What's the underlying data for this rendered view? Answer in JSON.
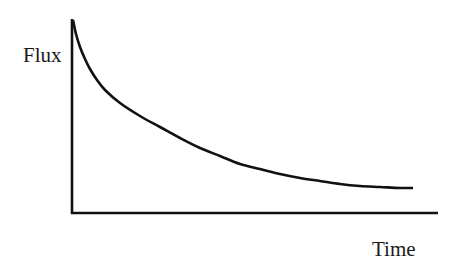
{
  "chart_data": {
    "type": "line",
    "title": "",
    "xlabel": "Time",
    "ylabel": "Flux",
    "xticks": [],
    "yticks": [],
    "grid": false,
    "legend": null,
    "series": [
      {
        "name": "Flux",
        "color": "#111111",
        "points_px": [
          [
            73,
            20
          ],
          [
            76,
            34
          ],
          [
            80,
            47
          ],
          [
            85,
            59
          ],
          [
            90,
            69
          ],
          [
            97,
            80
          ],
          [
            105,
            90
          ],
          [
            120,
            103
          ],
          [
            140,
            116
          ],
          [
            160,
            127
          ],
          [
            180,
            138
          ],
          [
            200,
            148
          ],
          [
            220,
            156
          ],
          [
            240,
            164
          ],
          [
            260,
            169
          ],
          [
            280,
            174
          ],
          [
            300,
            178
          ],
          [
            320,
            181
          ],
          [
            340,
            184
          ],
          [
            360,
            186
          ],
          [
            380,
            187
          ],
          [
            400,
            188
          ],
          [
            413,
            188
          ]
        ],
        "x_norm": [
          0.0,
          0.01,
          0.02,
          0.03,
          0.05,
          0.07,
          0.09,
          0.14,
          0.19,
          0.25,
          0.31,
          0.37,
          0.43,
          0.49,
          0.55,
          0.61,
          0.67,
          0.73,
          0.79,
          0.85,
          0.9,
          0.96,
          1.0
        ],
        "y_norm": [
          1.0,
          0.93,
          0.86,
          0.8,
          0.75,
          0.69,
          0.64,
          0.57,
          0.5,
          0.44,
          0.39,
          0.34,
          0.29,
          0.25,
          0.23,
          0.2,
          0.18,
          0.17,
          0.15,
          0.14,
          0.13,
          0.13,
          0.13
        ]
      }
    ],
    "axes_px": {
      "origin": [
        72,
        213
      ],
      "y_axis_top": [
        72,
        19
      ],
      "x_axis_right": [
        438,
        213
      ]
    }
  }
}
